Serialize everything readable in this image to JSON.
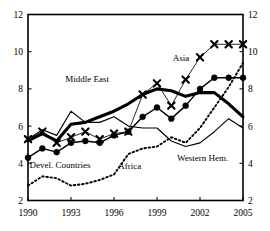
{
  "chart_data": {
    "type": "line",
    "title": "",
    "subtitle": "",
    "xlabel": "",
    "ylabel": "",
    "xlim": [
      1990,
      2005
    ],
    "ylim": [
      2,
      12
    ],
    "grid": false,
    "legend_position": "inline-annotations",
    "x_ticks": [
      "1990",
      "1993",
      "1996",
      "1999",
      "2002",
      "2005"
    ],
    "x_tick_values": [
      1990,
      1993,
      1996,
      1999,
      2002,
      2005
    ],
    "y_ticks_left": [
      "2",
      "4",
      "6",
      "8",
      "10",
      "12"
    ],
    "y_ticks_right": [
      "2",
      "4",
      "6",
      "8",
      "10",
      "12"
    ],
    "y_tick_values": [
      2,
      4,
      6,
      8,
      10,
      12
    ],
    "x": [
      1990,
      1991,
      1992,
      1993,
      1994,
      1995,
      1996,
      1997,
      1998,
      1999,
      2000,
      2001,
      2002,
      2003,
      2004,
      2005
    ],
    "series": [
      {
        "name": "Asia",
        "label": "Asia",
        "style": "thin-line-x-marker",
        "marker": "x",
        "color": "#000000",
        "values": [
          5.3,
          5.7,
          5.1,
          5.4,
          5.7,
          5.3,
          5.6,
          5.7,
          7.7,
          8.3,
          7.1,
          8.5,
          9.7,
          10.4,
          10.4,
          10.4
        ]
      },
      {
        "name": "Devel. Countries",
        "label": "Devel. Countries",
        "style": "medium-line-dot-marker",
        "marker": "circle",
        "color": "#000000",
        "values": [
          4.3,
          4.8,
          4.6,
          5.1,
          5.2,
          5.1,
          5.5,
          5.7,
          6.5,
          7.0,
          6.4,
          7.1,
          8.0,
          8.6,
          8.6,
          8.6
        ]
      },
      {
        "name": "Middle East",
        "label": "Middle East",
        "style": "thick-line",
        "marker": "none",
        "color": "#000000",
        "values": [
          5.2,
          5.6,
          5.2,
          6.1,
          6.2,
          6.5,
          6.8,
          7.2,
          7.7,
          8.0,
          7.9,
          7.6,
          7.8,
          7.8,
          7.2,
          6.5
        ]
      },
      {
        "name": "Western Hem.",
        "label": "Western Hem.",
        "style": "thin-line",
        "marker": "none",
        "color": "#000000",
        "values": [
          5.3,
          5.8,
          5.5,
          6.8,
          6.2,
          6.2,
          6.5,
          6.0,
          5.9,
          5.9,
          5.2,
          4.9,
          5.1,
          5.7,
          6.4,
          5.9
        ]
      },
      {
        "name": "Africa",
        "label": "Africa",
        "style": "dotted-line",
        "marker": "none",
        "color": "#000000",
        "values": [
          2.8,
          3.3,
          3.2,
          2.8,
          2.9,
          3.1,
          3.4,
          4.5,
          4.8,
          4.9,
          5.4,
          5.1,
          5.9,
          7.0,
          8.1,
          9.4
        ]
      }
    ],
    "annotations": [
      {
        "text": "Asia",
        "x": 2000.1,
        "y": 9.5
      },
      {
        "text": "Middle East",
        "x": 1992.6,
        "y": 8.35
      },
      {
        "text": "Devel. Countries",
        "x": 1990.1,
        "y": 3.75
      },
      {
        "text": "Africa",
        "x": 1996.3,
        "y": 3.72
      },
      {
        "text": "Western Hem.",
        "x": 2000.4,
        "y": 4.1
      }
    ]
  },
  "colors": {
    "frame": "#000000",
    "text": "#000000",
    "background": "#ffffff"
  }
}
